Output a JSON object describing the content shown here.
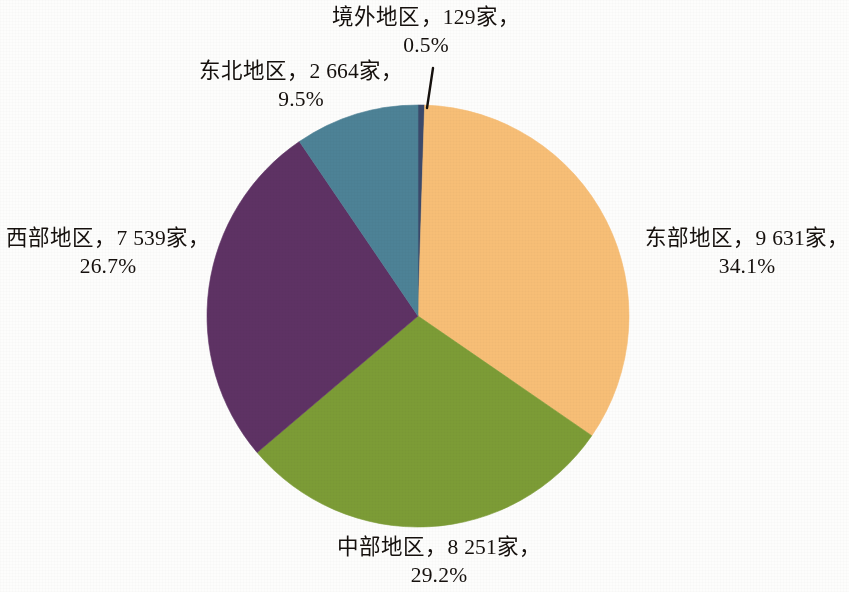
{
  "background_color": "#fdfdfc",
  "chart_data": {
    "type": "pie",
    "title": "",
    "subtitle": "",
    "xlabel": "",
    "ylabel": "",
    "legend_position": "none",
    "grid": false,
    "unit_suffix": "家",
    "start_angle_deg": 0,
    "direction": "clockwise",
    "center": {
      "x": 418,
      "y": 316
    },
    "radius": 211,
    "total_value": 28214,
    "categories": [
      "境外地区",
      "东部地区",
      "中部地区",
      "西部地区",
      "东北地区"
    ],
    "values": [
      129,
      9631,
      8251,
      7539,
      2664
    ],
    "percents": [
      0.5,
      34.1,
      29.2,
      26.7,
      9.5
    ],
    "value_texts": [
      "129",
      "9 631",
      "8 251",
      "7 539",
      "2 664"
    ],
    "percent_texts": [
      "0.5%",
      "34.1%",
      "29.2%",
      "26.7%",
      "9.5%"
    ],
    "colors": [
      "#3b4a6b",
      "#f7be76",
      "#7c9c36",
      "#5e3264",
      "#4d8296"
    ],
    "slices": [
      {
        "id": "overseas",
        "name": "境外地区",
        "value": 129,
        "value_text": "129",
        "percent": 0.5,
        "percent_text": "0.5%",
        "color": "#3b4a6b",
        "label_line1": "境外地区，129家，",
        "label_line2": "0.5%",
        "has_leader_line": true
      },
      {
        "id": "east",
        "name": "东部地区",
        "value": 9631,
        "value_text": "9 631",
        "percent": 34.1,
        "percent_text": "34.1%",
        "color": "#f7be76",
        "label_line1": "东部地区，9 631家，",
        "label_line2": "34.1%",
        "has_leader_line": false
      },
      {
        "id": "central",
        "name": "中部地区",
        "value": 8251,
        "value_text": "8 251",
        "percent": 29.2,
        "percent_text": "29.2%",
        "color": "#7c9c36",
        "label_line1": "中部地区，8 251家，",
        "label_line2": "29.2%",
        "has_leader_line": false
      },
      {
        "id": "west",
        "name": "西部地区",
        "value": 7539,
        "value_text": "7 539",
        "percent": 26.7,
        "percent_text": "26.7%",
        "color": "#5e3264",
        "label_line1": "西部地区，7 539家，",
        "label_line2": "26.7%",
        "has_leader_line": false
      },
      {
        "id": "northeast",
        "name": "东北地区",
        "value": 2664,
        "value_text": "2 664",
        "percent": 9.5,
        "percent_text": "9.5%",
        "color": "#4d8296",
        "label_line1": "东北地区，2 664家，",
        "label_line2": "9.5%",
        "has_leader_line": false
      }
    ]
  }
}
